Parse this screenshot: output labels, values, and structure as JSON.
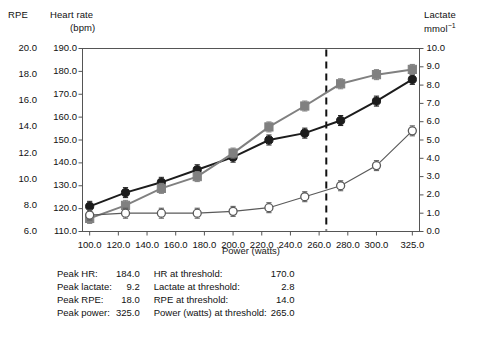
{
  "headers": {
    "rpe": "RPE",
    "hr_line1": "Heart rate",
    "hr_line2": "(bpm)",
    "lactate_line1": "Lactate",
    "lactate_line2_base": "mmol",
    "lactate_line2_sup": "−1"
  },
  "axes": {
    "rpe_ticks": [
      "20.0",
      "18.0",
      "16.0",
      "14.0",
      "12.0",
      "10.0",
      "8.0",
      "6.0"
    ],
    "hr_ticks": [
      "190.0",
      "180.0",
      "170.0",
      "160.0",
      "150.0",
      "140.0",
      "130.0",
      "120.0",
      "110.0"
    ],
    "lactate_ticks": [
      "10.0",
      "9.0",
      "8.0",
      "7.0",
      "6.0",
      "5.0",
      "4.0",
      "3.0",
      "2.0",
      "1.0",
      "0.0"
    ],
    "x_ticks": [
      "100.0",
      "120.0",
      "140.0",
      "160.0",
      "180.0",
      "200.0",
      "220.0",
      "240.0",
      "260.0",
      "280.0",
      "300.0",
      "325.0"
    ],
    "x_title": "Power (watts)"
  },
  "summary": {
    "rows": [
      {
        "label": "Peak HR:",
        "value": "184.0",
        "label2": "HR at threshold:",
        "value2": "170.0"
      },
      {
        "label": "Peak lactate:",
        "value": "9.2",
        "label2": "Lactate at threshold:",
        "value2": "2.8"
      },
      {
        "label": "Peak RPE:",
        "value": "18.0",
        "label2": "RPE at threshold:",
        "value2": "14.0"
      },
      {
        "label": "Peak power:",
        "value": "325.0",
        "label2": "Power (watts) at threshold:",
        "value2": "265.0"
      }
    ]
  },
  "colors": {
    "hr": "#1c1c1c",
    "rpe": "#808080",
    "lactate": "#5a5a5a",
    "threshold": "#111111",
    "frame": "#555555"
  },
  "chart_data": {
    "type": "line",
    "title": "",
    "xlabel": "Power (watts)",
    "ylabel": "Heart rate (bpm)",
    "xlim": [
      95,
      330
    ],
    "grid": false,
    "legend": "none",
    "x": [
      100,
      125,
      150,
      175,
      200,
      225,
      250,
      275,
      300,
      325
    ],
    "series": [
      {
        "name": "Heart rate",
        "axis": "hr",
        "unit": "bpm",
        "ylim": [
          110,
          190
        ],
        "marker": "filled-circle",
        "color": "#1c1c1c",
        "values": [
          121.0,
          127.0,
          131.5,
          137.0,
          142.5,
          150.0,
          153.0,
          158.5,
          167.0,
          176.5
        ]
      },
      {
        "name": "RPE",
        "axis": "rpe",
        "unit": "",
        "ylim": [
          6,
          20
        ],
        "marker": "filled-square",
        "color": "#808080",
        "values": [
          7.0,
          8.0,
          9.3,
          10.2,
          12.0,
          14.0,
          15.6,
          17.3,
          18.0,
          18.4
        ]
      },
      {
        "name": "Lactate",
        "axis": "lactate",
        "unit": "mmol−1",
        "ylim": [
          0,
          10
        ],
        "marker": "open-circle",
        "color": "#5a5a5a",
        "values": [
          0.9,
          1.0,
          1.0,
          1.0,
          1.1,
          1.3,
          1.9,
          2.5,
          3.6,
          5.5
        ]
      }
    ],
    "annotations": [
      {
        "type": "vline",
        "style": "dashed",
        "x": 265,
        "label": "threshold"
      }
    ]
  }
}
